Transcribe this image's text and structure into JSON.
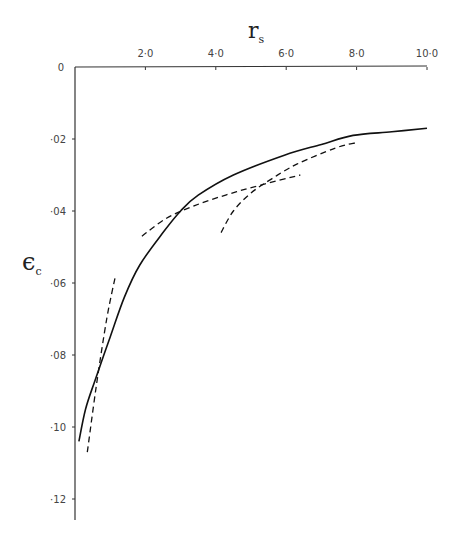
{
  "chart_data": {
    "type": "line",
    "title": "",
    "xlabel": "r_s",
    "ylabel": "ε_c",
    "x_axis_position": "top",
    "xlim": [
      0,
      10.0
    ],
    "ylim": [
      0,
      -0.125
    ],
    "y_inverted": true,
    "grid": false,
    "x_ticks": [
      "2·0",
      "4·0",
      "6·0",
      "8·0",
      "10·0"
    ],
    "x_tick_values": [
      2.0,
      4.0,
      6.0,
      8.0,
      10.0
    ],
    "y_ticks": [
      "0",
      "·02",
      "·04",
      "·06",
      "·08",
      "·10",
      "·12"
    ],
    "y_tick_values": [
      0,
      -0.02,
      -0.04,
      -0.06,
      -0.08,
      -0.1,
      -0.12
    ],
    "series": [
      {
        "name": "correlation energy (interpolated)",
        "style": "solid",
        "x": [
          0.11,
          0.3,
          0.57,
          1.0,
          1.4,
          1.84,
          2.5,
          3.0,
          3.5,
          4.5,
          5.95,
          7.0,
          7.9,
          9.0,
          10.0
        ],
        "y": [
          -0.104,
          -0.095,
          -0.087,
          -0.075,
          -0.064,
          -0.055,
          -0.046,
          -0.04,
          -0.0356,
          -0.03,
          -0.0245,
          -0.0215,
          -0.019,
          -0.018,
          -0.017
        ]
      },
      {
        "name": "high-density limit",
        "style": "dashed",
        "x": [
          0.35,
          0.6,
          0.9,
          1.15
        ],
        "y": [
          -0.107,
          -0.089,
          -0.07,
          -0.058
        ]
      },
      {
        "name": "intermediate-density approximation",
        "style": "dashed",
        "x": [
          1.9,
          2.6,
          3.4,
          4.3,
          5.2,
          6.4
        ],
        "y": [
          -0.047,
          -0.042,
          -0.0385,
          -0.0355,
          -0.033,
          -0.03
        ]
      },
      {
        "name": "low-density limit",
        "style": "dashed",
        "x": [
          4.15,
          4.5,
          5.0,
          5.6,
          6.3,
          7.4,
          8.0
        ],
        "y": [
          -0.046,
          -0.04,
          -0.035,
          -0.031,
          -0.027,
          -0.0225,
          -0.021
        ]
      }
    ]
  },
  "axes": {
    "x_title": "r",
    "x_title_sub": "s",
    "y_title": "ϵ",
    "y_title_sub": "c",
    "origin_label": "O"
  }
}
